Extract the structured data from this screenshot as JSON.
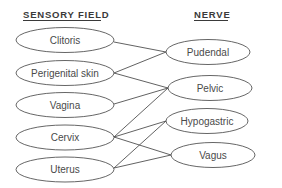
{
  "headers": {
    "left": "SENSORY FIELD",
    "right": "NERVE"
  },
  "sensory_fields": [
    {
      "id": "clitoris",
      "label": "Clitoris"
    },
    {
      "id": "perigenital",
      "label": "Perigenital skin"
    },
    {
      "id": "vagina",
      "label": "Vagina"
    },
    {
      "id": "cervix",
      "label": "Cervix"
    },
    {
      "id": "uterus",
      "label": "Uterus"
    }
  ],
  "nerves": [
    {
      "id": "pudendal",
      "label": "Pudendal"
    },
    {
      "id": "pelvic",
      "label": "Pelvic"
    },
    {
      "id": "hypogastric",
      "label": "Hypogastric"
    },
    {
      "id": "vagus",
      "label": "Vagus"
    }
  ],
  "connections": [
    {
      "from": "Clitoris",
      "to": "Pudendal"
    },
    {
      "from": "Perigenital skin",
      "to": "Pudendal"
    },
    {
      "from": "Perigenital skin",
      "to": "Pelvic"
    },
    {
      "from": "Vagina",
      "to": "Pelvic"
    },
    {
      "from": "Cervix",
      "to": "Pelvic"
    },
    {
      "from": "Cervix",
      "to": "Hypogastric"
    },
    {
      "from": "Cervix",
      "to": "Vagus"
    },
    {
      "from": "Uterus",
      "to": "Hypogastric"
    },
    {
      "from": "Uterus",
      "to": "Vagus"
    }
  ],
  "colors": {
    "stroke": "#555555",
    "text": "#4a4a4a",
    "background": "#ffffff"
  }
}
